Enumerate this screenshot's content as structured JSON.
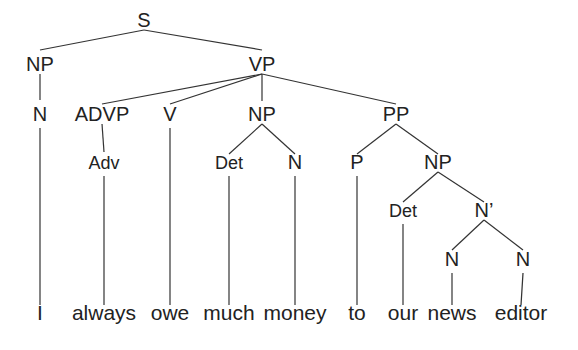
{
  "diagram": {
    "type": "syntax-tree",
    "sentence": "I always owe much money to our news editor",
    "line_color": "#333333",
    "text_color": "#222222",
    "nodes": [
      {
        "id": "s",
        "label": "S",
        "x": 144,
        "y": 28,
        "top": 30,
        "bot": 8,
        "small": false
      },
      {
        "id": "np1",
        "label": "NP",
        "x": 40,
        "y": 72,
        "top": 50,
        "bot": 74,
        "small": false
      },
      {
        "id": "vp",
        "label": "VP",
        "x": 262,
        "y": 72,
        "top": 50,
        "bot": 74,
        "small": false
      },
      {
        "id": "n1",
        "label": "N",
        "x": 40,
        "y": 122,
        "top": 100,
        "bot": 124,
        "small": false
      },
      {
        "id": "advp",
        "label": "ADVP",
        "x": 102,
        "y": 122,
        "top": 104,
        "bot": 124,
        "small": false
      },
      {
        "id": "v",
        "label": "V",
        "x": 170,
        "y": 122,
        "top": 104,
        "bot": 124,
        "small": false
      },
      {
        "id": "np2",
        "label": "NP",
        "x": 262,
        "y": 122,
        "top": 101,
        "bot": 124,
        "small": false
      },
      {
        "id": "pp",
        "label": "PP",
        "x": 396,
        "y": 122,
        "top": 104,
        "bot": 124,
        "small": false
      },
      {
        "id": "adv",
        "label": "Adv",
        "x": 104,
        "y": 170,
        "top": 152,
        "bot": 172,
        "small": true
      },
      {
        "id": "det1",
        "label": "Det",
        "x": 229,
        "y": 170,
        "top": 154,
        "bot": 172,
        "small": true
      },
      {
        "id": "n2",
        "label": "N",
        "x": 295,
        "y": 170,
        "top": 154,
        "bot": 172,
        "small": false
      },
      {
        "id": "p",
        "label": "P",
        "x": 357,
        "y": 170,
        "top": 154,
        "bot": 172,
        "small": false
      },
      {
        "id": "np3",
        "label": "NP",
        "x": 438,
        "y": 170,
        "top": 154,
        "bot": 172,
        "small": false
      },
      {
        "id": "det2",
        "label": "Det",
        "x": 403,
        "y": 218,
        "top": 202,
        "bot": 222,
        "small": true
      },
      {
        "id": "nbar",
        "label": "N’",
        "x": 484,
        "y": 218,
        "top": 202,
        "bot": 222,
        "small": false
      },
      {
        "id": "n3",
        "label": "N",
        "x": 452,
        "y": 267,
        "top": 250,
        "bot": 270,
        "small": false
      },
      {
        "id": "n4",
        "label": "N",
        "x": 523,
        "y": 267,
        "top": 250,
        "bot": 270,
        "small": false
      }
    ],
    "edges": [
      [
        "s",
        "np1"
      ],
      [
        "s",
        "vp"
      ],
      [
        "np1",
        "n1"
      ],
      [
        "vp",
        "advp"
      ],
      [
        "vp",
        "v"
      ],
      [
        "vp",
        "np2"
      ],
      [
        "vp",
        "pp"
      ],
      [
        "advp",
        "adv"
      ],
      [
        "np2",
        "det1"
      ],
      [
        "np2",
        "n2"
      ],
      [
        "pp",
        "p"
      ],
      [
        "pp",
        "np3"
      ],
      [
        "np3",
        "det2"
      ],
      [
        "np3",
        "nbar"
      ],
      [
        "nbar",
        "n3"
      ],
      [
        "nbar",
        "n4"
      ]
    ],
    "words": [
      {
        "id": "w1",
        "text": "I",
        "x": 40,
        "parent": "n1"
      },
      {
        "id": "w2",
        "text": "always",
        "x": 104,
        "parent": "adv"
      },
      {
        "id": "w3",
        "text": "owe",
        "x": 170,
        "parent": "v"
      },
      {
        "id": "w4",
        "text": "much",
        "x": 229,
        "parent": "det1"
      },
      {
        "id": "w5",
        "text": "money",
        "x": 295,
        "parent": "n2"
      },
      {
        "id": "w6",
        "text": "to",
        "x": 357,
        "parent": "p"
      },
      {
        "id": "w7",
        "text": "our",
        "x": 403,
        "parent": "det2"
      },
      {
        "id": "w8",
        "text": "news",
        "x": 452,
        "parent": "n3"
      },
      {
        "id": "w9",
        "text": "editor",
        "x": 521,
        "parent": "n4"
      }
    ],
    "word_baseline_y": 318,
    "word_line_bottom": 305
  }
}
